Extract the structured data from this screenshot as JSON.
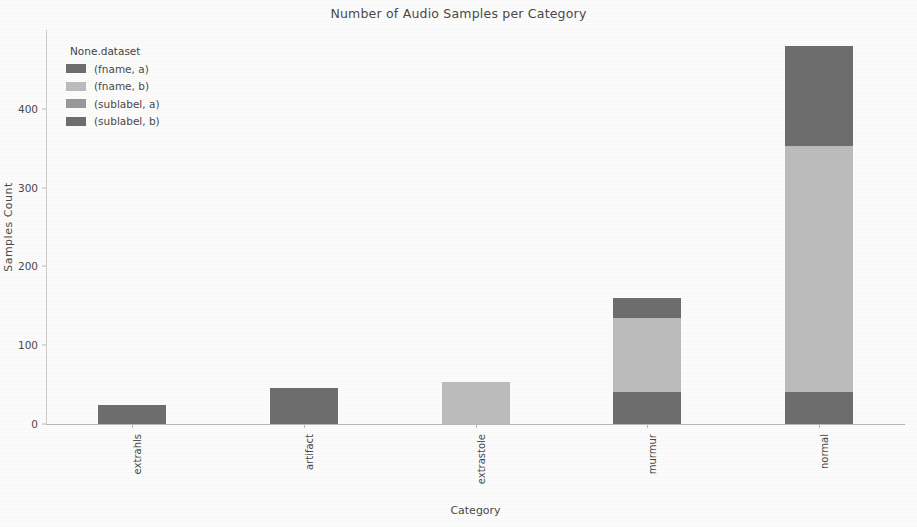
{
  "chart_data": {
    "type": "bar",
    "subtype": "stacked",
    "title": "Number of Audio Samples per Category",
    "xlabel": "Category",
    "ylabel": "Samples Count",
    "categories": [
      "extrahls",
      "artifact",
      "extrastole",
      "murmur",
      "normal"
    ],
    "ylim": [
      0,
      500
    ],
    "yticks": [
      0,
      100,
      200,
      300,
      400
    ],
    "ytick_labels": [
      "0",
      "100",
      "200",
      "300",
      "400"
    ],
    "grid": false,
    "legend": {
      "title": "None.dataset",
      "position": "upper left",
      "entries": [
        {
          "label": "(fname, a)",
          "color": "#6e6e6e"
        },
        {
          "label": "(fname, b)",
          "color": "#bdbdbd"
        },
        {
          "label": "(sublabel, a)",
          "color": "#9a9a9a"
        },
        {
          "label": "(sublabel, b)",
          "color": "#6e6e6e"
        }
      ]
    },
    "series": [
      {
        "name": "(fname, a)",
        "color": "#6e6e6e",
        "values": [
          24,
          46,
          0,
          40,
          40
        ]
      },
      {
        "name": "(fname, b)",
        "color": "#bdbdbd",
        "values": [
          0,
          0,
          53,
          95,
          313
        ]
      },
      {
        "name": "(sublabel, b)",
        "color": "#6e6e6e",
        "values": [
          0,
          0,
          0,
          25,
          127
        ]
      }
    ],
    "totals": [
      24,
      46,
      53,
      160,
      480
    ]
  }
}
